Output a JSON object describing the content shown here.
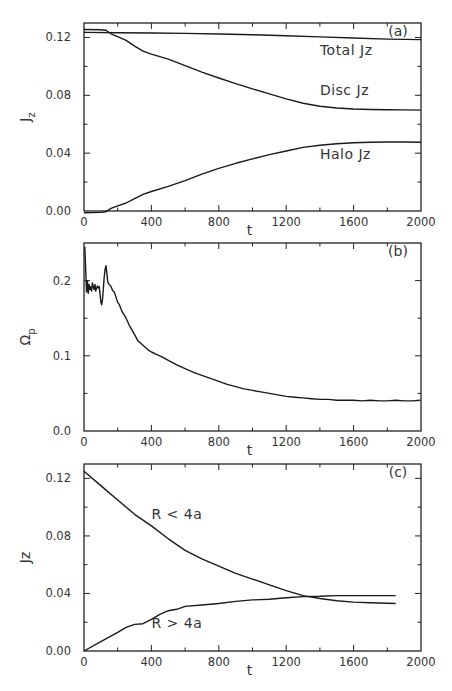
{
  "chart_data": [
    {
      "id": "a",
      "type": "line",
      "panel_tag": "(a)",
      "xlabel": "t",
      "ylabel": "J",
      "ylabel_sub": "z",
      "xlim": [
        0,
        2000
      ],
      "ylim": [
        0,
        0.13
      ],
      "xticks": [
        0,
        400,
        800,
        1200,
        1600,
        2000
      ],
      "xtick_labels": [
        "0",
        "400",
        "800",
        "1200",
        "1600",
        "2000"
      ],
      "xminor": [
        200,
        600,
        1000,
        1400,
        1800
      ],
      "yticks": [
        0.0,
        0.04,
        0.08,
        0.12
      ],
      "ytick_labels": [
        "0.00",
        "0.04",
        "0.08",
        "0.12"
      ],
      "yminor": [
        0.02,
        0.06,
        0.1
      ],
      "grid": false,
      "series": [
        {
          "name": "Total Jz",
          "label": "Total Jz",
          "label_at": [
            1400,
            0.108
          ],
          "x": [
            0,
            200,
            400,
            600,
            800,
            1000,
            1200,
            1400,
            1600,
            1800,
            2000
          ],
          "y": [
            0.1235,
            0.1233,
            0.1231,
            0.1228,
            0.1224,
            0.1219,
            0.1212,
            0.1204,
            0.1196,
            0.1189,
            0.1185
          ]
        },
        {
          "name": "Disc Jz",
          "label": "Disc Jz",
          "label_at": [
            1400,
            0.08
          ],
          "x": [
            0,
            100,
            130,
            160,
            200,
            250,
            300,
            350,
            400,
            500,
            600,
            700,
            800,
            900,
            1000,
            1100,
            1200,
            1300,
            1400,
            1500,
            1600,
            1700,
            1800,
            1900,
            2000
          ],
          "y": [
            0.1255,
            0.1254,
            0.125,
            0.1225,
            0.1205,
            0.118,
            0.114,
            0.1105,
            0.1085,
            0.105,
            0.1005,
            0.096,
            0.092,
            0.088,
            0.0845,
            0.081,
            0.0775,
            0.0745,
            0.0725,
            0.0712,
            0.0705,
            0.0702,
            0.07,
            0.0699,
            0.0698
          ]
        },
        {
          "name": "Halo Jz",
          "label": "Halo Jz",
          "label_at": [
            1400,
            0.036
          ],
          "x": [
            0,
            100,
            130,
            160,
            200,
            250,
            300,
            350,
            400,
            500,
            600,
            700,
            800,
            900,
            1000,
            1100,
            1200,
            1300,
            1400,
            1500,
            1600,
            1700,
            1800,
            1900,
            2000
          ],
          "y": [
            -0.0012,
            -0.001,
            -0.0005,
            0.0018,
            0.0035,
            0.0055,
            0.0085,
            0.0115,
            0.0135,
            0.017,
            0.021,
            0.0255,
            0.0295,
            0.033,
            0.036,
            0.039,
            0.0415,
            0.044,
            0.0455,
            0.0465,
            0.0472,
            0.0475,
            0.0477,
            0.0477,
            0.0476
          ]
        }
      ]
    },
    {
      "id": "b",
      "type": "line",
      "panel_tag": "(b)",
      "xlabel": "t",
      "ylabel": "Ω",
      "ylabel_sub": "p",
      "xlim": [
        0,
        2000
      ],
      "ylim": [
        0,
        0.25
      ],
      "xticks": [
        0,
        400,
        800,
        1200,
        1600,
        2000
      ],
      "xtick_labels": [
        "0",
        "400",
        "800",
        "1200",
        "1600",
        "2000"
      ],
      "xminor": [
        200,
        600,
        1000,
        1400,
        1800
      ],
      "yticks": [
        0.0,
        0.1,
        0.2
      ],
      "ytick_labels": [
        "0.0",
        "0.1",
        "0.2"
      ],
      "yminor": [
        0.05,
        0.15
      ],
      "grid": false,
      "series": [
        {
          "name": "Omega_p",
          "x": [
            5,
            10,
            15,
            20,
            25,
            30,
            35,
            40,
            45,
            50,
            55,
            60,
            65,
            70,
            75,
            80,
            85,
            90,
            95,
            100,
            105,
            110,
            115,
            120,
            125,
            130,
            135,
            140,
            145,
            150,
            160,
            170,
            180,
            190,
            200,
            210,
            220,
            230,
            240,
            250,
            260,
            270,
            280,
            290,
            300,
            320,
            340,
            360,
            380,
            400,
            430,
            460,
            500,
            550,
            600,
            650,
            700,
            750,
            800,
            850,
            900,
            950,
            1000,
            1050,
            1100,
            1150,
            1200,
            1250,
            1300,
            1350,
            1400,
            1450,
            1500,
            1550,
            1600,
            1650,
            1700,
            1750,
            1800,
            1850,
            1900,
            1950,
            1995
          ],
          "y": [
            0.245,
            0.215,
            0.185,
            0.2,
            0.183,
            0.195,
            0.188,
            0.192,
            0.186,
            0.197,
            0.192,
            0.188,
            0.195,
            0.186,
            0.19,
            0.193,
            0.19,
            0.192,
            0.183,
            0.172,
            0.168,
            0.175,
            0.19,
            0.205,
            0.215,
            0.22,
            0.212,
            0.2,
            0.196,
            0.195,
            0.192,
            0.187,
            0.185,
            0.178,
            0.171,
            0.168,
            0.162,
            0.157,
            0.154,
            0.15,
            0.145,
            0.14,
            0.136,
            0.132,
            0.128,
            0.12,
            0.116,
            0.112,
            0.108,
            0.105,
            0.102,
            0.099,
            0.094,
            0.088,
            0.083,
            0.078,
            0.074,
            0.07,
            0.066,
            0.062,
            0.059,
            0.056,
            0.054,
            0.052,
            0.05,
            0.048,
            0.046,
            0.045,
            0.044,
            0.043,
            0.042,
            0.042,
            0.041,
            0.041,
            0.041,
            0.04,
            0.041,
            0.04,
            0.04,
            0.041,
            0.04,
            0.04,
            0.041
          ]
        }
      ]
    },
    {
      "id": "c",
      "type": "line",
      "panel_tag": "(c)",
      "xlabel": "t",
      "ylabel": "Jz",
      "ylabel_sub": "",
      "xlim": [
        0,
        2000
      ],
      "ylim": [
        0,
        0.13
      ],
      "xticks": [
        0,
        400,
        800,
        1200,
        1600,
        2000
      ],
      "xtick_labels": [
        "0",
        "400",
        "800",
        "1200",
        "1600",
        "2000"
      ],
      "xminor": [
        200,
        600,
        1000,
        1400,
        1800
      ],
      "yticks": [
        0.0,
        0.04,
        0.08,
        0.12
      ],
      "ytick_labels": [
        "0.00",
        "0.04",
        "0.08",
        "0.12"
      ],
      "yminor": [
        0.02,
        0.06,
        0.1
      ],
      "grid": false,
      "series": [
        {
          "name": "R < 4a",
          "label": "R < 4a",
          "label_at": [
            400,
            0.092
          ],
          "x": [
            0,
            100,
            200,
            300,
            400,
            500,
            600,
            700,
            800,
            900,
            1000,
            1100,
            1200,
            1300,
            1400,
            1500,
            1600,
            1700,
            1850
          ],
          "y": [
            0.125,
            0.115,
            0.105,
            0.095,
            0.087,
            0.078,
            0.07,
            0.064,
            0.059,
            0.054,
            0.05,
            0.046,
            0.042,
            0.0385,
            0.0365,
            0.035,
            0.034,
            0.0335,
            0.033
          ]
        },
        {
          "name": "R > 4a",
          "label": "R > 4a",
          "label_at": [
            400,
            0.016
          ],
          "x": [
            0,
            100,
            200,
            250,
            300,
            350,
            400,
            450,
            500,
            550,
            600,
            700,
            800,
            900,
            1000,
            1100,
            1200,
            1300,
            1400,
            1500,
            1600,
            1700,
            1850
          ],
          "y": [
            0.0,
            0.0065,
            0.013,
            0.0165,
            0.0185,
            0.019,
            0.022,
            0.0255,
            0.028,
            0.029,
            0.031,
            0.032,
            0.033,
            0.0345,
            0.0355,
            0.036,
            0.037,
            0.0378,
            0.038,
            0.0385,
            0.0385,
            0.0385,
            0.0385
          ]
        }
      ]
    }
  ]
}
